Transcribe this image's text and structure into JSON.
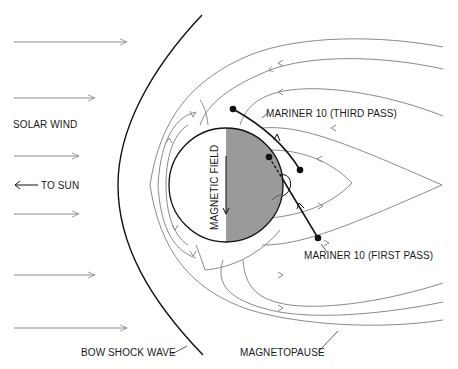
{
  "diagram": {
    "labels": {
      "solar_wind": "SOLAR WIND",
      "to_sun": "TO SUN",
      "magnetic_field": "MAGNETIC FIELD",
      "mariner_third": "MARINER 10 (THIRD PASS)",
      "mariner_first": "MARINER 10 (FIRST PASS)",
      "bow_shock": "BOW SHOCK WAVE",
      "magnetopause": "MAGNETOPAUSE"
    },
    "colors": {
      "planet_night_side": "#9a9a9a",
      "planet_day_side": "#ffffff",
      "field_lines": "#8a8a8a",
      "outline": "#111111"
    },
    "solar_wind_arrows": 6
  }
}
